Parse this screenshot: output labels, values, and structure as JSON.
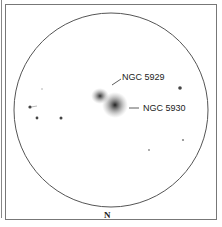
{
  "sketch": {
    "objects": [
      {
        "name": "NGC 5929",
        "label": "NGC 5929"
      },
      {
        "name": "NGC 5930",
        "label": "NGC 5930"
      }
    ],
    "orientation_label": "N",
    "colors": {
      "ink": "#222222",
      "circle": "#555555",
      "frame": "#777777"
    }
  }
}
